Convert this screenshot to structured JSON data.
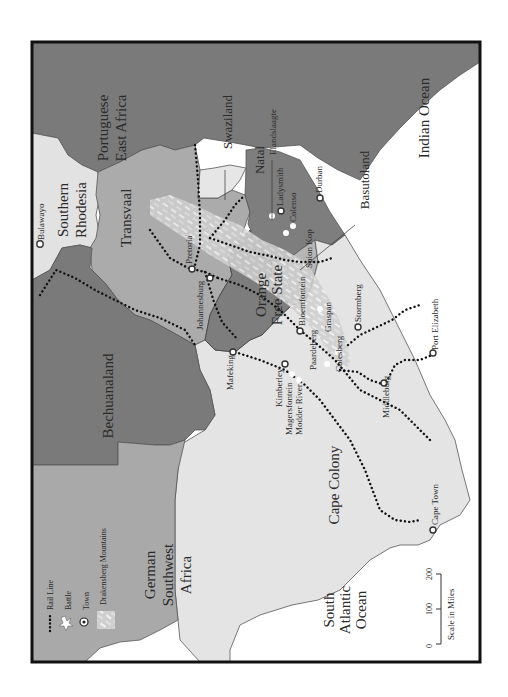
{
  "map": {
    "orientation": "rotated 90 degrees counter-clockwise (text reads bottom-to-top)",
    "colors": {
      "ocean": "#ffffff",
      "frame": "#111111",
      "dark_territory": "#7a7a7a",
      "mid_territory": "#aaaaaa",
      "light_territory": "#e4e4e4",
      "orange_free_state": "#7d7d7d",
      "drakensberg": "#c9c9c9",
      "rail": "#111111"
    },
    "regions": {
      "portuguese_east_africa": "Portuguese East Africa",
      "portuguese_line1": "Portuguese",
      "portuguese_line2": "East Africa",
      "swaziland": "Swaziland",
      "southern_rhodesia_line1": "Southern",
      "southern_rhodesia_line2": "Rhodesia",
      "transvaal": "Transvaal",
      "natal": "Natal",
      "basutoland": "Basutoland",
      "orange_line1": "Orange",
      "orange_line2": "Free State",
      "bechuanaland": "Bechuanaland",
      "german_line1": "German",
      "german_line2": "Southwest",
      "german_line3": "Africa",
      "cape_colony": "Cape Colony",
      "indian_ocean": "Indian Ocean",
      "atlantic_line1": "South",
      "atlantic_line2": "Atlantic",
      "atlantic_line3": "Ocean"
    },
    "towns": {
      "bulawayo": "Bulawayo",
      "pretoria": "Pretoria",
      "johannesburg": "Johannesburg",
      "mafeking": "Mafeking",
      "kimberley": "Kimberley",
      "bloemfontein": "Bloemfontein",
      "ladysmith": "Ladysmith",
      "durban": "Durban",
      "stormberg": "Stormberg",
      "middleburg": "Middleburg",
      "port_elizabeth": "Port Elizabeth",
      "cape_town": "Cape Town"
    },
    "battles": {
      "elandslaagte": "Elandslaagte",
      "colenso": "Colenso",
      "spion_kop": "Spion Kop",
      "graspan": "Graspan",
      "colesberg": "Colesberg",
      "paardeberg": "Paardeberg",
      "magersfontein": "Magersfontein",
      "modder_river": "Modder River"
    },
    "legend": {
      "rail_line": "Rail Line",
      "battle": "Battle",
      "town": "Town",
      "drakensberg": "Drakensberg Mountains"
    },
    "scale": {
      "title": "Scale in Miles",
      "ticks": [
        "0",
        "100",
        "200"
      ]
    }
  }
}
